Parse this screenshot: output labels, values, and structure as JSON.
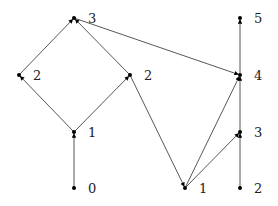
{
  "diagram": {
    "type": "hasse-diagram",
    "nodes": [
      {
        "id": "L0",
        "label": "0",
        "x": 74,
        "y": 188
      },
      {
        "id": "L1",
        "label": "1",
        "x": 74,
        "y": 132
      },
      {
        "id": "L2a",
        "label": "2",
        "x": 19,
        "y": 75
      },
      {
        "id": "L2b",
        "label": "2",
        "x": 130,
        "y": 75
      },
      {
        "id": "L3",
        "label": "3",
        "x": 74,
        "y": 18
      },
      {
        "id": "R1",
        "label": "1",
        "x": 185,
        "y": 188
      },
      {
        "id": "R2",
        "label": "2",
        "x": 240,
        "y": 188
      },
      {
        "id": "R3",
        "label": "3",
        "x": 240,
        "y": 132
      },
      {
        "id": "R4",
        "label": "4",
        "x": 240,
        "y": 75
      },
      {
        "id": "R5",
        "label": "5",
        "x": 240,
        "y": 18
      }
    ],
    "edges": [
      {
        "from": "L0",
        "to": "L1"
      },
      {
        "from": "L1",
        "to": "L2a"
      },
      {
        "from": "L1",
        "to": "L2b"
      },
      {
        "from": "L2a",
        "to": "L3"
      },
      {
        "from": "L2b",
        "to": "L3"
      },
      {
        "from": "L3",
        "to": "R4"
      },
      {
        "from": "L2b",
        "to": "R1"
      },
      {
        "from": "R1",
        "to": "R3"
      },
      {
        "from": "R1",
        "to": "R4"
      },
      {
        "from": "R2",
        "to": "R3"
      },
      {
        "from": "R3",
        "to": "R4"
      },
      {
        "from": "R4",
        "to": "R5"
      }
    ],
    "colors": {
      "edge": "#444444",
      "node": "#000000",
      "label": "#222222"
    }
  },
  "labels": {
    "L0": "0",
    "L1": "1",
    "L2a": "2",
    "L2b": "2",
    "L3": "3",
    "R1": "1",
    "R2": "2",
    "R3": "3",
    "R4": "4",
    "R5": "5"
  }
}
